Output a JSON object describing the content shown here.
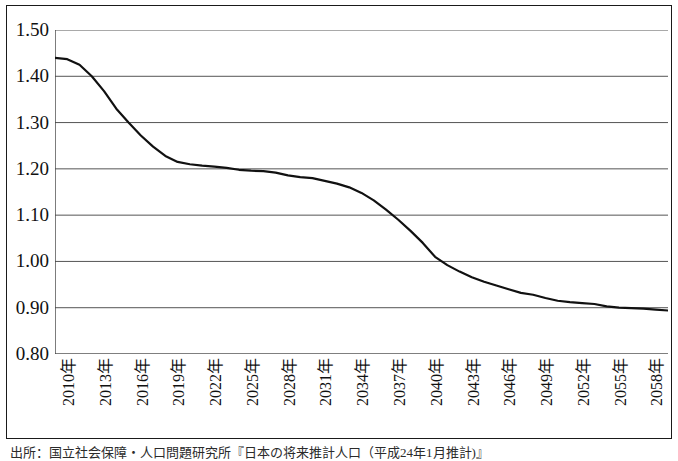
{
  "figure": {
    "caption": "出所：国立社会保障・人口問題研究所『日本の将来推計人口（平成24年1月推計)』"
  },
  "chart_data": {
    "type": "line",
    "title": "",
    "subtitle": "",
    "xlabel": "",
    "ylabel": "",
    "grid": true,
    "legend": false,
    "legend_position": "none",
    "line_color": "#111111",
    "background_color": "#ffffff",
    "axis_color": "#444444",
    "gridline_color": "#555555",
    "ylim": [
      0.8,
      1.5
    ],
    "yticks": [
      0.8,
      0.9,
      1.0,
      1.1,
      1.2,
      1.3,
      1.4,
      1.5
    ],
    "ytick_labels": [
      "0.80",
      "0.90",
      "1.00",
      "1.10",
      "1.20",
      "1.30",
      "1.40",
      "1.50"
    ],
    "xlim": [
      2010,
      2060
    ],
    "xtick_step_years": 1,
    "xtick_label_step_years": 3,
    "xtick_labels": [
      "2010年",
      "2013年",
      "2016年",
      "2019年",
      "2022年",
      "2025年",
      "2028年",
      "2031年",
      "2034年",
      "2037年",
      "2040年",
      "2043年",
      "2046年",
      "2049年",
      "2052年",
      "2055年",
      "2058年"
    ],
    "x": [
      2010,
      2011,
      2012,
      2013,
      2014,
      2015,
      2016,
      2017,
      2018,
      2019,
      2020,
      2021,
      2022,
      2023,
      2024,
      2025,
      2026,
      2027,
      2028,
      2029,
      2030,
      2031,
      2032,
      2033,
      2034,
      2035,
      2036,
      2037,
      2038,
      2039,
      2040,
      2041,
      2042,
      2043,
      2044,
      2045,
      2046,
      2047,
      2048,
      2049,
      2050,
      2051,
      2052,
      2053,
      2054,
      2055,
      2056,
      2057,
      2058,
      2059,
      2060
    ],
    "values": [
      1.44,
      1.437,
      1.425,
      1.4,
      1.368,
      1.33,
      1.3,
      1.272,
      1.248,
      1.228,
      1.215,
      1.21,
      1.207,
      1.205,
      1.202,
      1.198,
      1.196,
      1.195,
      1.192,
      1.186,
      1.182,
      1.18,
      1.174,
      1.168,
      1.16,
      1.148,
      1.132,
      1.112,
      1.09,
      1.066,
      1.04,
      1.01,
      0.992,
      0.978,
      0.966,
      0.956,
      0.948,
      0.94,
      0.932,
      0.928,
      0.921,
      0.915,
      0.912,
      0.91,
      0.908,
      0.903,
      0.9,
      0.899,
      0.898,
      0.896,
      0.894
    ],
    "series": [
      {
        "name": "合計特殊出生率",
        "values": [
          1.44,
          1.437,
          1.425,
          1.4,
          1.368,
          1.33,
          1.3,
          1.272,
          1.248,
          1.228,
          1.215,
          1.21,
          1.207,
          1.205,
          1.202,
          1.198,
          1.196,
          1.195,
          1.192,
          1.186,
          1.182,
          1.18,
          1.174,
          1.168,
          1.16,
          1.148,
          1.132,
          1.112,
          1.09,
          1.066,
          1.04,
          1.01,
          0.992,
          0.978,
          0.966,
          0.956,
          0.948,
          0.94,
          0.932,
          0.928,
          0.921,
          0.915,
          0.912,
          0.91,
          0.908,
          0.903,
          0.9,
          0.899,
          0.898,
          0.896,
          0.894
        ]
      }
    ]
  }
}
